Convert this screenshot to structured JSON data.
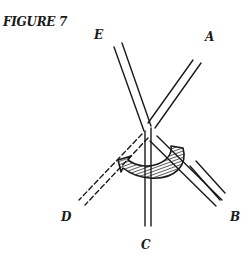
{
  "figure": {
    "title": "FIGURE 7",
    "labels": {
      "A": "A",
      "B": "B",
      "C": "C",
      "D": "D",
      "E": "E"
    },
    "colors": {
      "ink": "#1a1a1a",
      "background": "#ffffff"
    }
  }
}
